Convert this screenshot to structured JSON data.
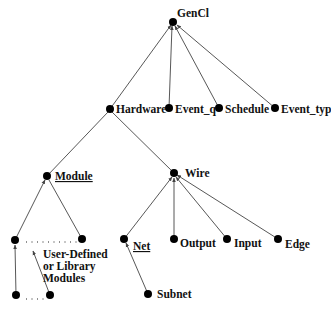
{
  "diagram": {
    "type": "class-hierarchy-tree",
    "root": "GenCl",
    "nodes": [
      {
        "id": "gencl",
        "label": "GenCl",
        "x": 173,
        "y": 22,
        "lx": 177,
        "ly": 17,
        "underline": false
      },
      {
        "id": "hardware",
        "label": "Hardware",
        "x": 110,
        "y": 109,
        "lx": 116,
        "ly": 113,
        "underline": false
      },
      {
        "id": "event_q",
        "label": "Event_q",
        "x": 169,
        "y": 108,
        "lx": 175,
        "ly": 113,
        "underline": false
      },
      {
        "id": "schedule",
        "label": "Schedule",
        "x": 219,
        "y": 108,
        "lx": 225,
        "ly": 113,
        "underline": false
      },
      {
        "id": "event_typ",
        "label": "Event_typ",
        "x": 275,
        "y": 108,
        "lx": 281,
        "ly": 113,
        "underline": false
      },
      {
        "id": "module",
        "label": "Module",
        "x": 47,
        "y": 176,
        "lx": 55,
        "ly": 180,
        "underline": true
      },
      {
        "id": "wire",
        "label": "Wire",
        "x": 174,
        "y": 173,
        "lx": 185,
        "ly": 177,
        "underline": false
      },
      {
        "id": "mod_left",
        "label": "",
        "x": 15,
        "y": 240
      },
      {
        "id": "mod_right",
        "label": "",
        "x": 82,
        "y": 239
      },
      {
        "id": "mod_bottom_left",
        "label": "",
        "x": 16,
        "y": 295
      },
      {
        "id": "mod_bottom_right",
        "label": "",
        "x": 50,
        "y": 295
      },
      {
        "id": "net",
        "label": "Net",
        "x": 124,
        "y": 239,
        "lx": 133,
        "ly": 250,
        "underline": true
      },
      {
        "id": "output",
        "label": "Output",
        "x": 174,
        "y": 239,
        "lx": 180,
        "ly": 247,
        "underline": false
      },
      {
        "id": "input",
        "label": "Input",
        "x": 227,
        "y": 239,
        "lx": 234,
        "ly": 247,
        "underline": false
      },
      {
        "id": "edge",
        "label": "Edge",
        "x": 278,
        "y": 239,
        "lx": 285,
        "ly": 248,
        "underline": false
      },
      {
        "id": "subnet",
        "label": "Subnet",
        "x": 148,
        "y": 294,
        "lx": 157,
        "ly": 298,
        "underline": false
      }
    ],
    "edges": [
      [
        "hardware",
        "gencl"
      ],
      [
        "event_q",
        "gencl"
      ],
      [
        "schedule",
        "gencl"
      ],
      [
        "event_typ",
        "gencl"
      ],
      [
        "module",
        "hardware"
      ],
      [
        "wire",
        "hardware"
      ],
      [
        "mod_left",
        "module"
      ],
      [
        "mod_right",
        "module"
      ],
      [
        "net",
        "wire"
      ],
      [
        "output",
        "wire"
      ],
      [
        "input",
        "wire"
      ],
      [
        "edge",
        "wire"
      ],
      [
        "subnet",
        "net"
      ]
    ],
    "annotation": {
      "lines": [
        "User-Defined",
        "or Library",
        "Modules"
      ]
    }
  }
}
